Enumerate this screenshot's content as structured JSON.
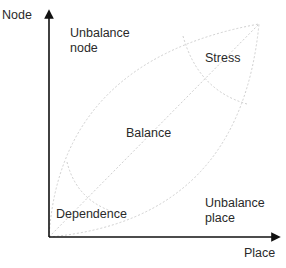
{
  "diagram": {
    "axes": {
      "y_label": "Node",
      "x_label": "Place"
    },
    "regions": {
      "unbalance_node": "Unbalance\nnode",
      "stress": "Stress",
      "balance": "Balance",
      "dependence": "Dependence",
      "unbalance_place": "Unbalance\nplace"
    },
    "colors": {
      "axis": "#111111",
      "guide": "#cfcfcf",
      "text": "#2a2a2a"
    }
  }
}
